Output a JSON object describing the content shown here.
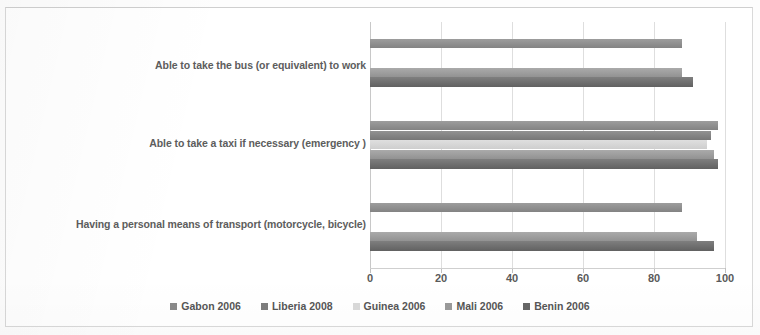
{
  "chart_data": {
    "type": "bar",
    "orientation": "horizontal",
    "title": "",
    "subtitle": "",
    "xlabel": "",
    "ylabel": "",
    "xlim": [
      0,
      100
    ],
    "xticks": [
      0,
      20,
      40,
      60,
      80,
      100
    ],
    "xtick_labels": [
      "0",
      "20",
      "40",
      "60",
      "80",
      "100"
    ],
    "grid": true,
    "grid_axis": "x",
    "legend_position": "bottom",
    "categories": [
      "Able to take the bus (or equivalent) to work",
      "Able to take a taxi if necessary (emergency )",
      "Having a personal means of transport (motorcycle, bicycle)"
    ],
    "series": [
      {
        "name": "Gabon 2006",
        "color": "#8a8a8a",
        "values": [
          88,
          98,
          88
        ]
      },
      {
        "name": "Liberia 2008",
        "color": "#7d7d7d",
        "values": [
          null,
          96,
          null
        ]
      },
      {
        "name": "Guinea 2006",
        "color": "#d9d9d9",
        "values": [
          null,
          95,
          null
        ]
      },
      {
        "name": "Mali 2006",
        "color": "#9a9a9a",
        "values": [
          88,
          97,
          92
        ]
      },
      {
        "name": "Benin 2006",
        "color": "#666666",
        "values": [
          91,
          98,
          97
        ]
      }
    ]
  },
  "legend": {
    "items": [
      {
        "label": "Gabon 2006",
        "color": "#8a8a8a"
      },
      {
        "label": "Liberia 2008",
        "color": "#7d7d7d"
      },
      {
        "label": "Guinea 2006",
        "color": "#d9d9d9"
      },
      {
        "label": "Mali 2006",
        "color": "#9a9a9a"
      },
      {
        "label": "Benin 2006",
        "color": "#666666"
      }
    ]
  },
  "axis": {
    "x_tick_labels": [
      "0",
      "20",
      "40",
      "60",
      "80",
      "100"
    ]
  },
  "category_labels": [
    "Able to take the bus (or equivalent) to work",
    "Able to take a taxi if necessary (emergency )",
    "Having a personal means of transport (motorcycle, bicycle)"
  ]
}
